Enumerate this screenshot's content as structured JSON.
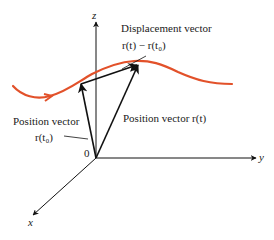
{
  "diagram": {
    "axes": {
      "z_label": "z",
      "y_label": "y",
      "x_label": "x",
      "origin_label": "0"
    },
    "labels": {
      "displacement_title": "Displacement vector",
      "displacement_expr": "r(t) − r(t₀)",
      "position_r0_title": "Position vector",
      "position_r0_expr": "r(t₀)",
      "position_rt_text": "Position vector r(t)"
    },
    "colors": {
      "curve": "#e2512a",
      "vectors": "#111111",
      "axes": "#111111"
    }
  }
}
